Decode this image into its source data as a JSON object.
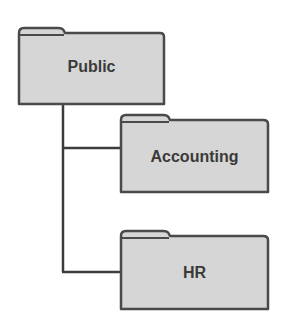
{
  "diagram": {
    "type": "folder-tree",
    "colors": {
      "folder_fill": "#d6d6d6",
      "folder_border": "#4a4a4a",
      "connector": "#3c3c3c",
      "label": "#3a3a3a",
      "background": "#ffffff"
    },
    "root": {
      "label": "Public",
      "icon": "folder-icon",
      "children": [
        {
          "label": "Accounting",
          "icon": "folder-icon"
        },
        {
          "label": "HR",
          "icon": "folder-icon"
        }
      ]
    }
  }
}
